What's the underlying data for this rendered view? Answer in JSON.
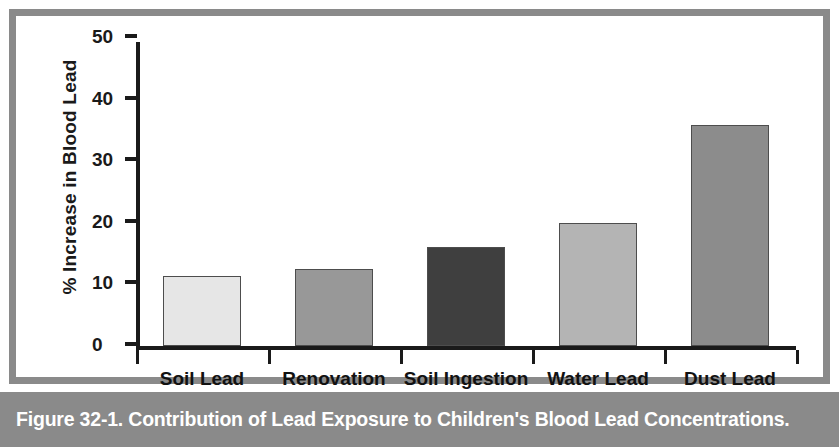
{
  "caption": "Figure 32-1. Contribution of Lead Exposure to Children's Blood Lead Concentrations.",
  "colors": {
    "frame": "#8a8a8a",
    "caption_bar": "#8a8a8a",
    "caption_text": "#ffffff",
    "axis": "#1a1a1a",
    "plot_background": "#ffffff",
    "bar_outline": "#4d4d4d"
  },
  "chart_data": {
    "type": "bar",
    "title": "",
    "xlabel": "",
    "ylabel": "% Increase in Blood Lead",
    "ylim": [
      0,
      50
    ],
    "yticks": [
      0,
      10,
      20,
      30,
      40,
      50
    ],
    "ytick_labels": [
      "0",
      "10",
      "20",
      "30",
      "40",
      "50"
    ],
    "grid": false,
    "legend": "none",
    "categories": [
      "Soil Lead",
      "Renovation",
      "Soil Ingestion",
      "Water Lead",
      "Dust Lead"
    ],
    "values": [
      11.3,
      12.5,
      16.0,
      20.0,
      35.8
    ],
    "bar_colors": [
      "#e6e6e6",
      "#989898",
      "#3f3f3f",
      "#b4b4b4",
      "#8c8c8c"
    ]
  }
}
